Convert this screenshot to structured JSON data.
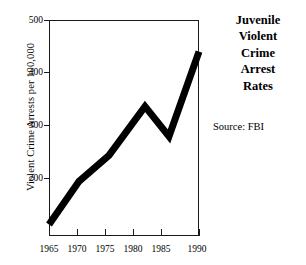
{
  "chart_data": {
    "type": "line",
    "title": "Juvenile Violent Crime Arrest Rates",
    "title_lines": [
      "Juvenile",
      "Violent",
      "Crime",
      "Arrest",
      "Rates"
    ],
    "source": "Source: FBI",
    "xlabel": "",
    "ylabel": "Violent Crime Arrests per 100,000",
    "xlim": [
      1965,
      1990
    ],
    "ylim": [
      125,
      500
    ],
    "grid": false,
    "legend": false,
    "xticks": [
      1965,
      1970,
      1975,
      1980,
      1985,
      1990
    ],
    "xtick_labels": [
      "1965",
      "1970",
      "1975",
      "1980",
      "1985",
      "1990"
    ],
    "yticks": [
      200,
      300,
      400,
      500
    ],
    "ytick_labels": [
      "200",
      "300",
      "400",
      "500"
    ],
    "line_color": "#000000",
    "line_width_px": 7,
    "x": [
      1965,
      1970,
      1975,
      1981,
      1985,
      1990
    ],
    "values": [
      145,
      220,
      265,
      350,
      298,
      445
    ],
    "series": [
      {
        "name": "Juvenile Violent Crime Arrest Rate",
        "points": [
          {
            "year": 1965,
            "rate": 145
          },
          {
            "year": 1970,
            "rate": 220
          },
          {
            "year": 1975,
            "rate": 265
          },
          {
            "year": 1981,
            "rate": 350
          },
          {
            "year": 1985,
            "rate": 298
          },
          {
            "year": 1990,
            "rate": 445
          }
        ]
      }
    ]
  }
}
